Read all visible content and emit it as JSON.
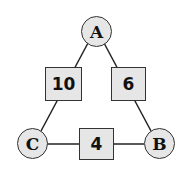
{
  "nodes": {
    "A": "A",
    "B": "B",
    "C": "C"
  },
  "edges": {
    "AC": "10",
    "AB": "6",
    "CB": "4"
  },
  "colors": {
    "fill": "#e6e6e6",
    "stroke": "#333333"
  }
}
